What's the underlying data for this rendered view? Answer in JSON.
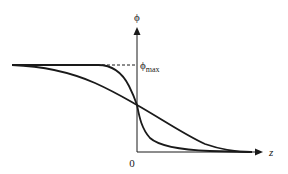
{
  "diagram": {
    "type": "profile-plot",
    "y_axis": {
      "label": "ϕ"
    },
    "x_axis": {
      "label": "z",
      "origin_label": "0"
    },
    "reference_line": {
      "label_base": "ϕ",
      "label_sub": "max",
      "style": "dashed"
    },
    "curves": [
      {
        "name": "steep-profile",
        "description": "sharp sigmoid drop centered at z=0"
      },
      {
        "name": "gentle-profile",
        "description": "broad sigmoid drop centered at z=0"
      }
    ],
    "colors": {
      "stroke": "#1a1a1a",
      "background": "#ffffff"
    }
  }
}
